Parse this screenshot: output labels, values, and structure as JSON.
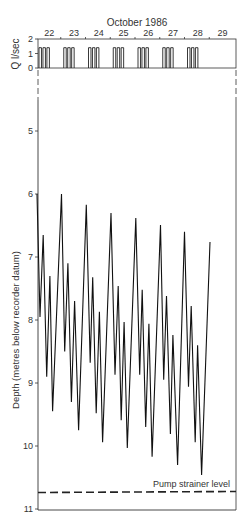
{
  "chart_data": [
    {
      "type": "bar",
      "panel": "discharge",
      "title": "October 1986",
      "ylabel": "Q l/sec",
      "ylim": [
        0,
        2
      ],
      "yticks": [
        0,
        1,
        2
      ],
      "xlabel": "",
      "day_labels": [
        "22",
        "23",
        "24",
        "25",
        "26",
        "27",
        "28",
        "29"
      ],
      "xlim": [
        22,
        30
      ],
      "pulse_level": 1.4,
      "pulses_per_day": 3,
      "pumping_days": [
        22,
        23,
        24,
        25,
        26,
        27,
        28
      ],
      "pulses": [
        {
          "start": 22.0,
          "end": 22.1
        },
        {
          "start": 22.16,
          "end": 22.26
        },
        {
          "start": 22.32,
          "end": 22.42
        },
        {
          "start": 23.0,
          "end": 23.1
        },
        {
          "start": 23.16,
          "end": 23.26
        },
        {
          "start": 23.32,
          "end": 23.42
        },
        {
          "start": 24.0,
          "end": 24.1
        },
        {
          "start": 24.16,
          "end": 24.26
        },
        {
          "start": 24.32,
          "end": 24.42
        },
        {
          "start": 25.0,
          "end": 25.1
        },
        {
          "start": 25.16,
          "end": 25.26
        },
        {
          "start": 25.32,
          "end": 25.42
        },
        {
          "start": 26.0,
          "end": 26.1
        },
        {
          "start": 26.16,
          "end": 26.26
        },
        {
          "start": 26.32,
          "end": 26.42
        },
        {
          "start": 27.0,
          "end": 27.1
        },
        {
          "start": 27.16,
          "end": 27.26
        },
        {
          "start": 27.32,
          "end": 27.42
        },
        {
          "start": 28.0,
          "end": 28.1
        },
        {
          "start": 28.16,
          "end": 28.26
        },
        {
          "start": 28.32,
          "end": 28.42
        }
      ]
    },
    {
      "type": "line",
      "panel": "water-level",
      "title": "",
      "xlabel": "",
      "ylabel": "Depth (metres below recorder datum)",
      "ylim": [
        11,
        4
      ],
      "y_inverted": true,
      "yticks": [
        5,
        6,
        7,
        8,
        9,
        10,
        11
      ],
      "xlim": [
        22,
        30
      ],
      "axis_break_at_top": true,
      "series": [
        {
          "name": "Water level",
          "x": [
            21.96,
            22.08,
            22.21,
            22.35,
            22.48,
            22.59,
            22.95,
            23.08,
            23.21,
            23.35,
            23.48,
            23.64,
            23.95,
            24.11,
            24.21,
            24.35,
            24.48,
            24.61,
            24.95,
            25.11,
            25.24,
            25.36,
            25.48,
            25.61,
            25.95,
            26.11,
            26.21,
            26.35,
            26.48,
            26.61,
            26.95,
            27.08,
            27.19,
            27.35,
            27.45,
            27.64,
            27.92,
            28.08,
            28.19,
            28.35,
            28.45,
            28.61,
            28.95
          ],
          "y": [
            6.0,
            7.95,
            6.65,
            8.9,
            7.3,
            9.45,
            6.0,
            8.5,
            7.1,
            9.3,
            7.7,
            9.75,
            6.17,
            8.68,
            7.32,
            9.48,
            7.87,
            9.94,
            6.3,
            8.87,
            7.46,
            9.59,
            8.03,
            10.03,
            6.38,
            8.87,
            7.52,
            9.7,
            8.06,
            10.17,
            6.49,
            8.95,
            7.62,
            9.81,
            8.24,
            10.3,
            6.6,
            9.06,
            7.78,
            9.94,
            8.4,
            10.46,
            6.76
          ]
        }
      ],
      "reference_lines": [
        {
          "label": "Pump strainer level",
          "y": 10.73,
          "style": "dashed"
        }
      ],
      "grid": false
    }
  ],
  "labels": {
    "month": "October 1986",
    "q_axis": "Q l/sec",
    "depth_axis": "Depth (metres below recorder datum)",
    "strainer": "Pump strainer level"
  }
}
